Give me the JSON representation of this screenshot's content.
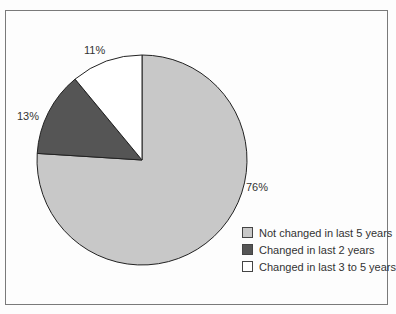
{
  "chart_data": {
    "type": "pie",
    "title": "",
    "categories": [
      "Not changed in last 5 years",
      "Changed in last 2 years",
      "Changed in last 3 to 5 years"
    ],
    "values": [
      76,
      13,
      11
    ],
    "labels": [
      "76%",
      "13%",
      "11%"
    ],
    "colors": [
      "#c8c8c8",
      "#555555",
      "#ffffff"
    ],
    "start_angle": "12 o'clock, clockwise",
    "legend_position": "lower right"
  },
  "legend": [
    {
      "label": "Not changed in last 5 years",
      "color": "#c8c8c8"
    },
    {
      "label": "Changed in last 2 years",
      "color": "#555555"
    },
    {
      "label": "Changed in last 3 to 5 years",
      "color": "#ffffff"
    }
  ]
}
